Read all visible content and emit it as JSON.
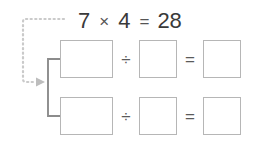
{
  "worksheet": {
    "title": "Multiplication to division fact family",
    "equation": {
      "factor_a": "7",
      "multiply_symbol": "×",
      "factor_b": "4",
      "equals_symbol": "=",
      "product": "28"
    },
    "arrow": {
      "style": "dotted",
      "color": "#c9c9c9",
      "head": "filled-triangle-right"
    },
    "bracket": {
      "color": "#8c8c8c",
      "style": "solid"
    },
    "rows": [
      {
        "id": "division-row-1",
        "dividend": "",
        "divide_symbol": "÷",
        "divisor": "",
        "equals_symbol": "=",
        "quotient": ""
      },
      {
        "id": "division-row-2",
        "dividend": "",
        "divide_symbol": "÷",
        "divisor": "",
        "equals_symbol": "=",
        "quotient": ""
      }
    ]
  },
  "colors": {
    "background": "#ffffff",
    "text": "#3a3a3a",
    "symbol": "#5a5a5a",
    "box_border": "#b6b6b6",
    "bracket": "#8c8c8c",
    "arrow": "#c9c9c9"
  }
}
